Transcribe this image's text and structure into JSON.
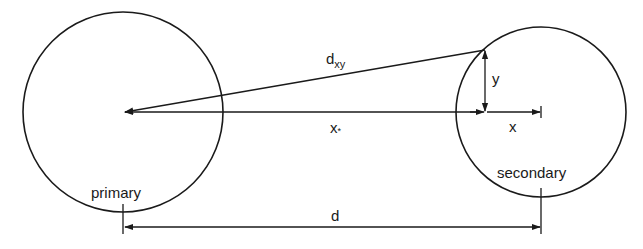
{
  "diagram": {
    "type": "binary-star geometry",
    "colors": {
      "line": "#1a1a1a",
      "background": "#ffffff"
    },
    "bodies": {
      "primary": {
        "label": "primary",
        "cx": 123,
        "cy": 112,
        "r": 100
      },
      "secondary": {
        "label": "secondary",
        "cx": 541,
        "cy": 112,
        "r": 85
      }
    },
    "point": {
      "x": 485,
      "y": 50
    },
    "labels": {
      "dxy_main": "d",
      "dxy_sub": "xy",
      "xstar": "x",
      "xstar_mark": "*",
      "y": "y",
      "x": "x",
      "d": "d"
    }
  }
}
